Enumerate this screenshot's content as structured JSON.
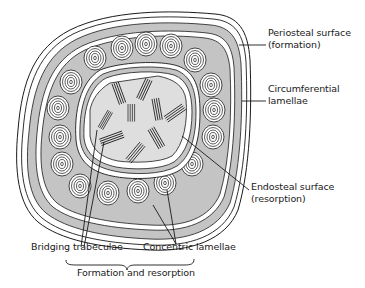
{
  "diagram": {
    "colors": {
      "gray_fill": "#c4c4c4",
      "inner_fill": "#dedede",
      "line": "#1a1a1a",
      "background": "#ffffff"
    },
    "labels": {
      "periosteal_line1": "Periosteal surface",
      "periosteal_line2": "(formation)",
      "circumferential_line1": "Circumferential",
      "circumferential_line2": "lamellae",
      "endosteal_line1": "Endosteal surface",
      "endosteal_line2": "(resorption)",
      "bridging": "Bridging trabeculae",
      "concentric": "Concentric lamellae",
      "formation_resorption": "Formation and resorption"
    }
  }
}
